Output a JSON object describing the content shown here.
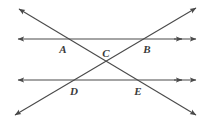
{
  "figure": {
    "type": "geometry-diagram",
    "canvas": {
      "width": 212,
      "height": 125,
      "background": "#ffffff"
    },
    "stroke_color": "#4a4a4a",
    "label_color": "#3a3a3a",
    "stroke_width": 1.1,
    "lines": [
      {
        "id": "upper-horizontal-line",
        "name": "upper-parallel-line",
        "x1": 18,
        "y1": 39,
        "x2": 196,
        "y2": 39,
        "arrow_start": true,
        "arrow_end": true,
        "double_arrow_end": true
      },
      {
        "id": "lower-horizontal-line",
        "name": "lower-parallel-line",
        "x1": 18,
        "y1": 80,
        "x2": 196,
        "y2": 80,
        "arrow_start": true,
        "arrow_end": true,
        "double_arrow_end": true
      },
      {
        "id": "diagonal-down-right",
        "name": "transversal-line-ne-to-sw",
        "x1": 19,
        "y1": 9,
        "x2": 196,
        "y2": 115,
        "arrow_start": true,
        "arrow_end": true,
        "double_arrow_end": false
      },
      {
        "id": "diagonal-up-right",
        "name": "transversal-line-sw-to-ne",
        "x1": 15,
        "y1": 115,
        "x2": 196,
        "y2": 8,
        "arrow_start": true,
        "arrow_end": true,
        "double_arrow_end": false
      }
    ],
    "points": [
      {
        "id": "A",
        "label": "A",
        "x": 67,
        "y": 39,
        "label_x": 63,
        "label_y": 49
      },
      {
        "id": "B",
        "label": "B",
        "x": 143,
        "y": 39,
        "label_x": 147,
        "label_y": 49
      },
      {
        "id": "C",
        "label": "C",
        "x": 106,
        "y": 61,
        "label_x": 106,
        "label_y": 53
      },
      {
        "id": "D",
        "label": "D",
        "x": 78,
        "y": 80,
        "label_x": 74,
        "label_y": 91
      },
      {
        "id": "E",
        "label": "E",
        "x": 132,
        "y": 80,
        "label_x": 138,
        "label_y": 91
      }
    ]
  }
}
